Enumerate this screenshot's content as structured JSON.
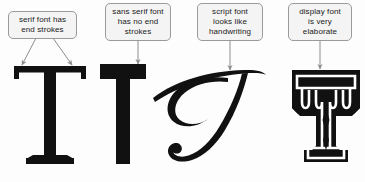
{
  "diagram": {
    "background_color": "#fdfdfd",
    "ink_color": "#111111",
    "callout_fill": "#f4f4f4",
    "callout_border": "#9a9a9a",
    "connector_color": "#8d8d8d"
  },
  "callouts": [
    {
      "id": "serif",
      "lines": [
        "serif font has",
        "end strokes"
      ],
      "line1": "serif font has",
      "line2": "end strokes",
      "line3": "",
      "arrows": 2
    },
    {
      "id": "sans",
      "lines": [
        "sans serif font",
        "has no end",
        "strokes"
      ],
      "line1": "sans serif font",
      "line2": "has no end",
      "line3": "strokes",
      "arrows": 1
    },
    {
      "id": "script",
      "lines": [
        "script font",
        "looks like",
        "handwriting"
      ],
      "line1": "script font",
      "line2": "looks like",
      "line3": "handwriting",
      "arrows": 1
    },
    {
      "id": "display",
      "lines": [
        "display font",
        "is very",
        "elaborate"
      ],
      "line1": "display font",
      "line2": "is very",
      "line3": "elaborate",
      "arrows": 1
    }
  ],
  "glyphs": [
    {
      "id": "serif",
      "letter": "T",
      "style": "serif",
      "description": "bold slab serif capital T with end strokes on both arms and foot"
    },
    {
      "id": "sans",
      "letter": "T",
      "style": "sans-serif",
      "description": "bold sans serif capital T with flat plain terminals"
    },
    {
      "id": "script",
      "letter": "T",
      "style": "script",
      "description": "calligraphic script capital T with swash loop and ball terminal"
    },
    {
      "id": "display",
      "letter": "T",
      "style": "display",
      "description": "ornate display capital T with white inline and diamond ornaments"
    }
  ]
}
